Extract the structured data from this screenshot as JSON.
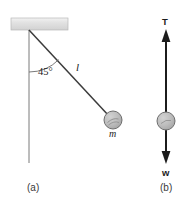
{
  "figure": {
    "panels": [
      {
        "id": "a",
        "caption": "(a)",
        "caption_x": 27,
        "caption_y": 183,
        "description": "pendulum bob of mass m hanging from ceiling on string of length l displaced 45 degrees from vertical",
        "labels": {
          "angle": "45°",
          "length": "l",
          "mass": "m"
        },
        "geometry": {
          "ceiling": {
            "x": 11,
            "y": 18,
            "width": 57,
            "height": 12
          },
          "pivot": {
            "x": 29,
            "y": 30
          },
          "vertical_line_end": {
            "x": 29,
            "y": 163
          },
          "string_end": {
            "x": 108,
            "y": 113
          },
          "bob": {
            "cx": 113,
            "cy": 120,
            "r": 9
          },
          "arc_radius": 42,
          "angle_degrees": 45
        },
        "label_positions": {
          "angle": {
            "x": 38,
            "y": 67
          },
          "length": {
            "x": 76,
            "y": 62
          },
          "mass": {
            "x": 109,
            "y": 129
          }
        }
      },
      {
        "id": "b",
        "caption": "(b)",
        "caption_x": 160,
        "caption_y": 183,
        "description": "free body diagram of bob with tension T upward and weight w downward",
        "labels": {
          "tension": "T",
          "weight": "w"
        },
        "geometry": {
          "bob": {
            "cx": 166,
            "cy": 121,
            "r": 9
          },
          "tension_arrow": {
            "x": 166,
            "y_tail": 121,
            "y_head": 31
          },
          "weight_arrow": {
            "x": 166,
            "y_tail": 121,
            "y_head": 164
          }
        },
        "label_positions": {
          "tension": {
            "x": 162,
            "y": 17
          },
          "weight": {
            "x": 162,
            "y": 168
          }
        }
      }
    ],
    "colors": {
      "line": "#1c1c1c",
      "string": "#3b3b3b",
      "ceiling_fill": "#e0e0e0",
      "ceiling_edge": "#b8b8b8",
      "bob_fill": "#b9b9b9",
      "bob_edge": "#6e6e6e",
      "bob_highlight": "#8d8d8d",
      "thin_line": "#6b6b6b",
      "background": "#ffffff",
      "caption_text": "#3a3a3a"
    }
  }
}
